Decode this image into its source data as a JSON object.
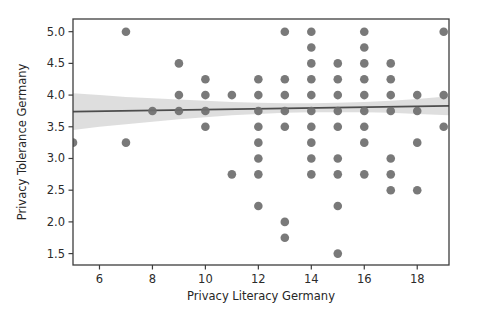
{
  "chart_data": {
    "type": "scatter",
    "title": "",
    "xlabel": "Privacy Literacy Germany",
    "ylabel": "Privacy Tolerance Germany",
    "xlim": [
      5.0,
      19.2
    ],
    "ylim": [
      1.32,
      5.2
    ],
    "xticks": [
      6,
      8,
      10,
      12,
      14,
      16,
      18
    ],
    "xtick_labels": [
      "6",
      "8",
      "10",
      "12",
      "14",
      "16",
      "18"
    ],
    "yticks": [
      1.5,
      2.0,
      2.5,
      3.0,
      3.5,
      4.0,
      4.5,
      5.0
    ],
    "ytick_labels": [
      "1.5",
      "2.0",
      "2.5",
      "3.0",
      "3.5",
      "4.0",
      "4.5",
      "5.0"
    ],
    "grid": false,
    "legend": null,
    "marker_color": "#6e6e6e",
    "line_color": "#4d4d4d",
    "band_color": "#c9c9c9",
    "points": [
      {
        "x": 5,
        "y": 3.25
      },
      {
        "x": 7,
        "y": 5.0
      },
      {
        "x": 7,
        "y": 3.25
      },
      {
        "x": 8,
        "y": 3.75
      },
      {
        "x": 9,
        "y": 4.5
      },
      {
        "x": 9,
        "y": 4.0
      },
      {
        "x": 9,
        "y": 3.75
      },
      {
        "x": 10,
        "y": 4.25
      },
      {
        "x": 10,
        "y": 4.0
      },
      {
        "x": 10,
        "y": 3.75
      },
      {
        "x": 10,
        "y": 3.5
      },
      {
        "x": 11,
        "y": 4.0
      },
      {
        "x": 11,
        "y": 2.75
      },
      {
        "x": 12,
        "y": 4.25
      },
      {
        "x": 12,
        "y": 4.0
      },
      {
        "x": 12,
        "y": 3.75
      },
      {
        "x": 12,
        "y": 3.5
      },
      {
        "x": 12,
        "y": 3.25
      },
      {
        "x": 12,
        "y": 3.0
      },
      {
        "x": 12,
        "y": 2.75
      },
      {
        "x": 12,
        "y": 2.25
      },
      {
        "x": 13,
        "y": 5.0
      },
      {
        "x": 13,
        "y": 4.25
      },
      {
        "x": 13,
        "y": 4.0
      },
      {
        "x": 13,
        "y": 3.75
      },
      {
        "x": 13,
        "y": 3.5
      },
      {
        "x": 13,
        "y": 2.0
      },
      {
        "x": 13,
        "y": 1.75
      },
      {
        "x": 14,
        "y": 5.0
      },
      {
        "x": 14,
        "y": 4.75
      },
      {
        "x": 14,
        "y": 4.5
      },
      {
        "x": 14,
        "y": 4.25
      },
      {
        "x": 14,
        "y": 4.0
      },
      {
        "x": 14,
        "y": 3.75
      },
      {
        "x": 14,
        "y": 3.5
      },
      {
        "x": 14,
        "y": 3.25
      },
      {
        "x": 14,
        "y": 3.0
      },
      {
        "x": 14,
        "y": 2.75
      },
      {
        "x": 15,
        "y": 4.5
      },
      {
        "x": 15,
        "y": 4.25
      },
      {
        "x": 15,
        "y": 4.0
      },
      {
        "x": 15,
        "y": 3.75
      },
      {
        "x": 15,
        "y": 3.5
      },
      {
        "x": 15,
        "y": 3.0
      },
      {
        "x": 15,
        "y": 2.75
      },
      {
        "x": 15,
        "y": 2.25
      },
      {
        "x": 15,
        "y": 1.5
      },
      {
        "x": 16,
        "y": 5.0
      },
      {
        "x": 16,
        "y": 4.75
      },
      {
        "x": 16,
        "y": 4.5
      },
      {
        "x": 16,
        "y": 4.25
      },
      {
        "x": 16,
        "y": 4.0
      },
      {
        "x": 16,
        "y": 3.75
      },
      {
        "x": 16,
        "y": 3.5
      },
      {
        "x": 16,
        "y": 3.25
      },
      {
        "x": 16,
        "y": 2.75
      },
      {
        "x": 17,
        "y": 4.5
      },
      {
        "x": 17,
        "y": 4.25
      },
      {
        "x": 17,
        "y": 4.0
      },
      {
        "x": 17,
        "y": 3.75
      },
      {
        "x": 17,
        "y": 3.0
      },
      {
        "x": 17,
        "y": 2.75
      },
      {
        "x": 17,
        "y": 2.5
      },
      {
        "x": 18,
        "y": 4.0
      },
      {
        "x": 18,
        "y": 3.75
      },
      {
        "x": 18,
        "y": 3.25
      },
      {
        "x": 18,
        "y": 2.5
      },
      {
        "x": 19,
        "y": 5.0
      },
      {
        "x": 19,
        "y": 4.0
      },
      {
        "x": 19,
        "y": 3.5
      }
    ],
    "regression_line": {
      "x": [
        5.0,
        19.2
      ],
      "y": [
        3.74,
        3.83
      ]
    },
    "confidence_band": {
      "x": [
        5.0,
        6.0,
        7.0,
        8.0,
        9.0,
        10.0,
        11.0,
        12.0,
        13.0,
        14.0,
        15.0,
        16.0,
        17.0,
        18.0,
        19.2
      ],
      "upper": [
        4.03,
        4.0,
        3.97,
        3.95,
        3.93,
        3.91,
        3.89,
        3.88,
        3.87,
        3.87,
        3.88,
        3.89,
        3.91,
        3.94,
        3.98
      ],
      "lower": [
        3.45,
        3.5,
        3.54,
        3.58,
        3.62,
        3.65,
        3.68,
        3.7,
        3.72,
        3.73,
        3.73,
        3.73,
        3.72,
        3.7,
        3.68
      ]
    }
  }
}
